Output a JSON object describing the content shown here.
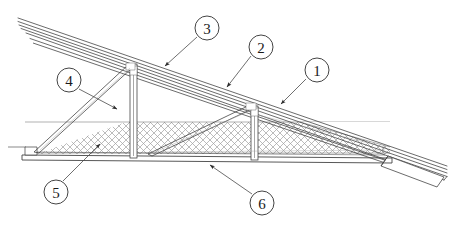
{
  "figure": {
    "type": "technical-line-drawing",
    "background_color": "#ffffff",
    "line_color": "#333333",
    "hatch_color": "#9a9a9a",
    "callout_circle_fill": "#ffffff",
    "callout_text_color": "#1a1a1a"
  },
  "callouts": [
    {
      "id": "callout-1",
      "label": "1",
      "cx": 317,
      "cy": 70,
      "r": 12,
      "leader": {
        "x1": 306,
        "y1": 79,
        "x2": 281,
        "y2": 104
      },
      "target_component": "roof-covering-assembly"
    },
    {
      "id": "callout-2",
      "label": "2",
      "cx": 261,
      "cy": 47,
      "r": 12,
      "leader": {
        "x1": 251,
        "y1": 56,
        "x2": 227,
        "y2": 87
      },
      "target_component": "rafter-top-chord"
    },
    {
      "id": "callout-3",
      "label": "3",
      "cx": 207,
      "cy": 28,
      "r": 12,
      "leader": {
        "x1": 197,
        "y1": 37,
        "x2": 165,
        "y2": 66
      },
      "target_component": "roof-sheathing-battens"
    },
    {
      "id": "callout-4",
      "label": "4",
      "cx": 69,
      "cy": 80,
      "r": 12,
      "leader": {
        "x1": 79,
        "y1": 89,
        "x2": 117,
        "y2": 109
      },
      "target_component": "diagonal-web-strut"
    },
    {
      "id": "callout-5",
      "label": "5",
      "cx": 56,
      "cy": 192,
      "r": 12,
      "leader": {
        "x1": 63,
        "y1": 181,
        "x2": 100,
        "y2": 144
      },
      "target_component": "thermal-insulation-layer"
    },
    {
      "id": "callout-6",
      "label": "6",
      "cx": 262,
      "cy": 203,
      "r": 12,
      "leader": {
        "x1": 252,
        "y1": 194,
        "x2": 210,
        "y2": 165
      },
      "target_component": "ceiling-bottom-chord"
    }
  ],
  "components": [
    {
      "key": "roof-covering-assembly",
      "name": "Roof covering assembly",
      "callout": "1"
    },
    {
      "key": "rafter-top-chord",
      "name": "Rafter / top chord",
      "callout": "2"
    },
    {
      "key": "roof-sheathing-battens",
      "name": "Sheathing and battens",
      "callout": "3"
    },
    {
      "key": "diagonal-web-strut",
      "name": "Diagonal web strut",
      "callout": "4"
    },
    {
      "key": "thermal-insulation-layer",
      "name": "Thermal insulation layer",
      "callout": "5"
    },
    {
      "key": "ceiling-bottom-chord",
      "name": "Ceiling / bottom chord",
      "callout": "6"
    }
  ],
  "geometry": {
    "canvas": {
      "width": 458,
      "height": 230
    },
    "roof_slope_lines": [
      {
        "x1": 22,
        "y1": 20,
        "x2": 447,
        "y2": 167
      },
      {
        "x1": 22,
        "y1": 24,
        "x2": 447,
        "y2": 171
      },
      {
        "x1": 24,
        "y1": 28,
        "x2": 447,
        "y2": 175
      },
      {
        "x1": 30,
        "y1": 33,
        "x2": 445,
        "y2": 179
      }
    ],
    "rafter_line": {
      "x1": 32,
      "y1": 38,
      "x2": 399,
      "y2": 165
    },
    "bottom_chord": {
      "x1": 22,
      "y1": 156,
      "x2": 392,
      "y2": 160
    },
    "posts": [
      {
        "x": 131,
        "y_top": 65,
        "y_bottom": 158,
        "width": 7
      },
      {
        "x": 252,
        "y_top": 107,
        "y_bottom": 160,
        "width": 7
      }
    ],
    "struts": [
      {
        "x1": 36,
        "y1": 154,
        "x2": 132,
        "y2": 66
      },
      {
        "x1": 150,
        "y1": 155,
        "x2": 252,
        "y2": 108
      }
    ],
    "insulation_band": {
      "y_top": 122,
      "y_bottom": 154,
      "x_left": 24,
      "x_right": 390
    }
  }
}
